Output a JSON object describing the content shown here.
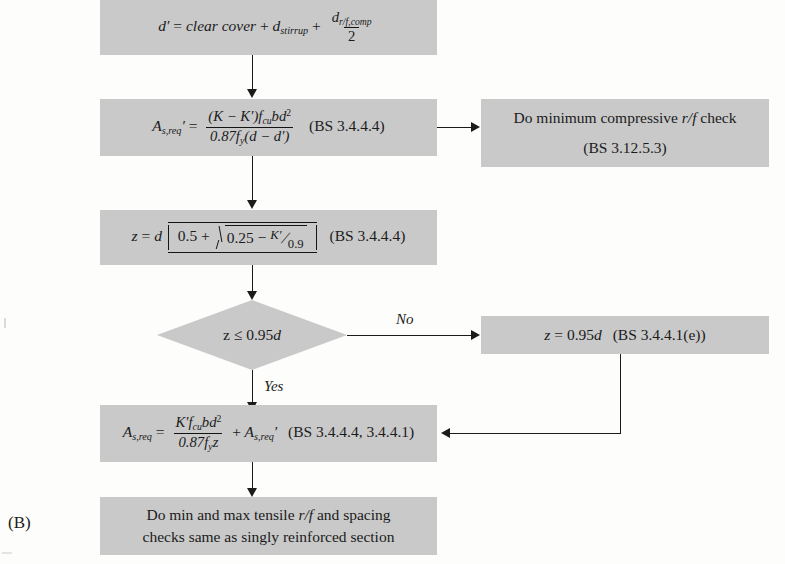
{
  "figure": {
    "label": "(B)",
    "caption_id": "flowchart-doubly-reinforced-section-design",
    "background_color": "#fdfdfc",
    "node_fill_color": "#c9c9c9",
    "line_color": "#1b1b1b"
  },
  "nodes": [
    {
      "id": "node-effective-depth",
      "type": "process",
      "text_plain": "d' = clear cover + d_stirrup + d_r/f,comp / 2",
      "parts": {
        "lhs": "d'",
        "equals": "=",
        "term1": "clear cover",
        "plus1": "+",
        "term2_base": "d",
        "term2_sub": "stirrup",
        "plus2": "+",
        "frac_num_base": "d",
        "frac_num_sub": "r/f,comp",
        "frac_den": "2"
      }
    },
    {
      "id": "node-compression-steel-area",
      "type": "process",
      "text_plain": "A_s,req' = (K - K')f_cu b d^2 / 0.87 f_y (d - d')   (BS 3.4.4.4)",
      "parts": {
        "lhs_base": "A",
        "lhs_sub": "s,req",
        "lhs_prime": "'",
        "equals": "=",
        "num": "(K - K')f_cu bd^2",
        "den": "0.87f_y(d - d')",
        "reference": "(BS 3.4.4.4)"
      }
    },
    {
      "id": "node-min-compressive-check",
      "type": "process",
      "line1": "Do minimum compressive r/f check",
      "line2": "(BS 3.12.5.3)",
      "reference": "(BS 3.12.5.3)"
    },
    {
      "id": "node-lever-arm",
      "type": "process",
      "text_plain": "z = d[0.5 + sqrt(0.25 - K'/0.9)]   (BS 3.4.4.4)",
      "parts": {
        "lhs": "z",
        "equals": "=",
        "d": "d",
        "bracket_open": "[",
        "first": "0.5",
        "plus": "+",
        "radicand_lead": "0.25",
        "minus": "−",
        "frac_num": "K'",
        "frac_den": "0.9",
        "bracket_close": "]",
        "reference": "(BS 3.4.4.4)"
      }
    },
    {
      "id": "node-decision-lever-arm",
      "type": "decision",
      "text_plain": "z ≤ 0.95d",
      "parts": {
        "lhs": "z",
        "op": "≤",
        "rhs_value": "0.95",
        "rhs_var": "d"
      }
    },
    {
      "id": "node-lever-arm-capped",
      "type": "process",
      "text_plain": "z = 0.95d   (BS 3.4.4.1(e))",
      "parts": {
        "lhs": "z",
        "equals": "=",
        "value": "0.95",
        "var": "d",
        "reference": "(BS 3.4.4.1(e))"
      }
    },
    {
      "id": "node-tension-steel-area",
      "type": "process",
      "text_plain": "A_s,req = K' f_cu b d^2 / 0.87 f_y z + A_s,req'   (BS 3.4.4.4, 3.4.4.1)",
      "parts": {
        "lhs_base": "A",
        "lhs_sub": "s,req",
        "equals": "=",
        "num": "K'f_cu bd^2",
        "den": "0.87f_y z",
        "plus": "+",
        "add_base": "A",
        "add_sub": "s,req",
        "add_prime": "'",
        "reference": "(BS 3.4.4.4, 3.4.4.1)"
      }
    },
    {
      "id": "node-final-checks",
      "type": "process",
      "line1": "Do min and max tensile r/f and spacing",
      "line2": "checks same as singly reinforced section"
    }
  ],
  "edge_labels": {
    "no": "No",
    "yes": "Yes"
  }
}
